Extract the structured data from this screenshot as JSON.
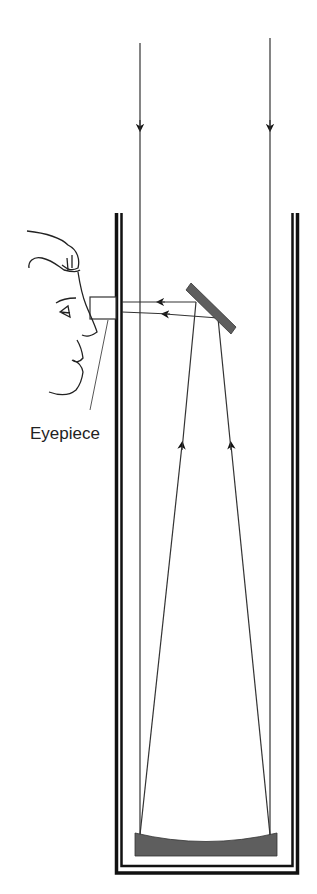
{
  "diagram": {
    "type": "newtonian-reflecting-telescope",
    "labels": {
      "eyepiece": "Eyepiece"
    },
    "colors": {
      "tube": "#111111",
      "mirror": "#5e5e5e",
      "ray": "#333333"
    }
  }
}
